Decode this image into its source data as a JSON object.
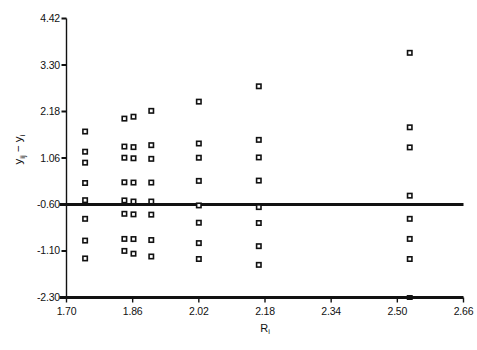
{
  "figure": {
    "title_fragment": "",
    "background": "#ffffff",
    "ink_color": "#111111"
  },
  "chart_data": {
    "type": "scatter",
    "title": "",
    "xlabel": "R_i",
    "xlabel_base": "R",
    "xlabel_sub": "i",
    "ylabel": "y_ij - y_i",
    "ylabel_parts": [
      "y",
      "ij",
      " − ",
      "y",
      "i"
    ],
    "xlim": [
      1.7,
      2.66
    ],
    "ylim": [
      -2.3,
      4.42
    ],
    "grid": false,
    "legend": null,
    "xticks": [
      1.7,
      1.86,
      2.02,
      2.18,
      2.34,
      2.5,
      2.66
    ],
    "xticklabels": [
      "1.70",
      "1.86",
      "2.02",
      "2.18",
      "2.34",
      "2.50",
      "2.66"
    ],
    "yticks": [
      4.42,
      3.3,
      2.18,
      1.06,
      -0.6,
      -1.1,
      -2.3
    ],
    "yticklabels": [
      "4.42",
      "3.30",
      "2.18",
      "1.06",
      "-0.60",
      "-1.10",
      "-2.30"
    ],
    "ytick_pixel_fractions": [
      0.0,
      0.1667,
      0.3333,
      0.5,
      0.6667,
      0.8333,
      1.0
    ],
    "reference_lines": [
      {
        "name": "upper-reference-line",
        "y_level_label": "-0.60",
        "y_fraction": 0.6667,
        "width_px": 3
      },
      {
        "name": "lower-reference-line",
        "y_level_label": "-2.30",
        "y_fraction": 1.0,
        "width_px": 3
      }
    ],
    "marker": {
      "shape": "open-square",
      "size_px": 6,
      "edge": "#111111",
      "face": "#ffffff"
    },
    "series": [
      {
        "name": "residuals",
        "columns": [
          {
            "x": 1.745,
            "y_fracs": [
              0.4051,
              0.4774,
              0.5167,
              0.5896,
              0.6512,
              0.718,
              0.796,
              0.86
            ]
          },
          {
            "x": 1.84,
            "y_fracs": [
              0.3588,
              0.459,
              0.499,
              0.587,
              0.652,
              0.7,
              0.79,
              0.833
            ]
          },
          {
            "x": 1.862,
            "y_fracs": [
              0.352,
              0.461,
              0.501,
              0.588,
              0.656,
              0.702,
              0.7905,
              0.843
            ]
          },
          {
            "x": 1.905,
            "y_fracs": [
              0.331,
              0.454,
              0.503,
              0.588,
              0.656,
              0.703,
              0.794,
              0.853
            ]
          },
          {
            "x": 2.02,
            "y_fracs": [
              0.298,
              0.448,
              0.499,
              0.582,
              0.67,
              0.732,
              0.805,
              0.862
            ]
          },
          {
            "x": 2.165,
            "y_fracs": [
              0.243,
              0.435,
              0.498,
              0.581,
              0.676,
              0.733,
              0.816,
              0.883
            ]
          },
          {
            "x": 2.53,
            "y_fracs": [
              0.123,
              0.39,
              0.462,
              0.635,
              0.718,
              0.79,
              0.862
            ]
          }
        ]
      }
    ],
    "baseline_marker": {
      "name": "baseline-filled-marker",
      "x": 2.53,
      "y_fraction": 1.0,
      "filled": true
    }
  }
}
